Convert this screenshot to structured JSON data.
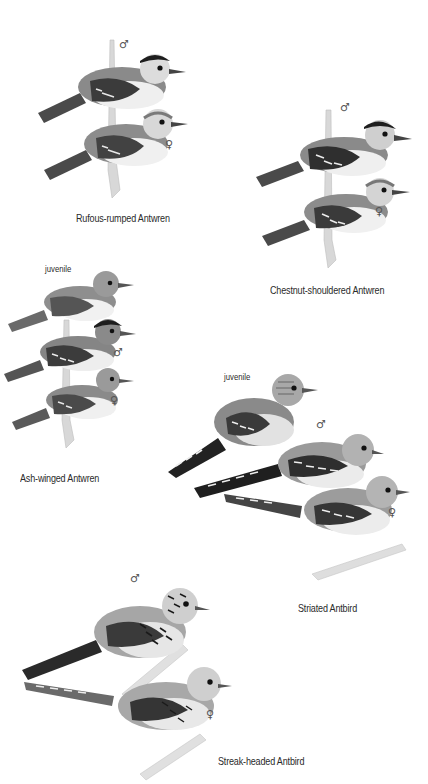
{
  "plate": {
    "background": "#ffffff",
    "species": [
      {
        "name": "Rufous-rumped Antwren",
        "figures": [
          {
            "label": "♂",
            "role": "male"
          },
          {
            "label": "♀",
            "role": "female"
          }
        ]
      },
      {
        "name": "Chestnut-shouldered Antwren",
        "figures": [
          {
            "label": "♂",
            "role": "male"
          },
          {
            "label": "♀",
            "role": "female"
          }
        ]
      },
      {
        "name": "Ash-winged Antwren",
        "figures": [
          {
            "label": "juvenile",
            "role": "juvenile"
          },
          {
            "label": "♂",
            "role": "male"
          },
          {
            "label": "♀",
            "role": "female"
          }
        ]
      },
      {
        "name": "Striated Antbird",
        "figures": [
          {
            "label": "juvenile",
            "role": "juvenile"
          },
          {
            "label": "♂",
            "role": "male"
          },
          {
            "label": "♀",
            "role": "female"
          }
        ]
      },
      {
        "name": "Streak-headed Antbird",
        "figures": [
          {
            "label": "♂",
            "role": "male"
          },
          {
            "label": "♀",
            "role": "female"
          }
        ]
      }
    ]
  }
}
